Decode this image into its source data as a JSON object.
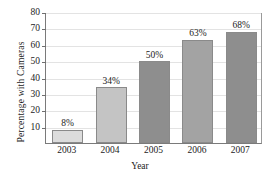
{
  "chart_data": {
    "type": "bar",
    "title": "",
    "xlabel": "Year",
    "ylabel": "Percentage with Cameras",
    "categories": [
      "2003",
      "2004",
      "2005",
      "2006",
      "2007"
    ],
    "values": [
      8,
      34,
      50,
      63,
      68
    ],
    "data_labels": [
      "8%",
      "34%",
      "50%",
      "63%",
      "68%"
    ],
    "bar_colors": [
      "#dcdcdc",
      "#c4c4c4",
      "#8e8e8e",
      "#a3a3a3",
      "#8e8e8e"
    ],
    "bar_border_color": "#8a8a8a",
    "ylim": [
      0,
      80
    ],
    "yticks": [
      10,
      20,
      30,
      40,
      50,
      60,
      70,
      80
    ],
    "ytick_labels": [
      "10",
      "20",
      "30",
      "40",
      "50",
      "60",
      "70",
      "80"
    ],
    "grid": true,
    "grid_color": "#e3e3e3",
    "legend": null,
    "axis_color": "#7a7a7a",
    "background": "#ffffff"
  }
}
